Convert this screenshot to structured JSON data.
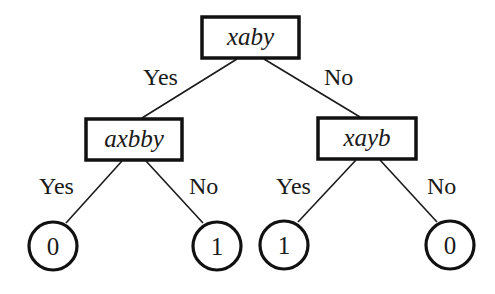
{
  "diagram": {
    "type": "decision-tree",
    "root": {
      "label": "xaby",
      "yes_label": "Yes",
      "no_label": "No",
      "yes": {
        "label": "axbby",
        "yes_label": "Yes",
        "no_label": "No",
        "yes_leaf": "0",
        "no_leaf": "1"
      },
      "no": {
        "label": "xayb",
        "yes_label": "Yes",
        "no_label": "No",
        "yes_leaf": "1",
        "no_leaf": "0"
      }
    }
  }
}
